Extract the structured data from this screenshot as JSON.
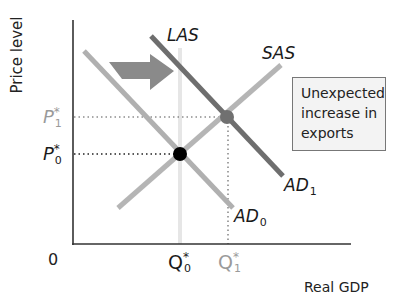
{
  "axes": {
    "y_label": "Price level",
    "x_label": "Real GDP",
    "origin_label": "0"
  },
  "price_levels": [
    {
      "symbol": "P",
      "star": "*",
      "subscript": "1",
      "color": "#9a9a9a"
    },
    {
      "symbol": "P",
      "star": "*",
      "subscript": "0",
      "color": "#1a1a1a"
    }
  ],
  "quantities": [
    {
      "symbol": "Q",
      "star": "*",
      "subscript": "0",
      "color": "#1a1a1a"
    },
    {
      "symbol": "Q",
      "star": "*",
      "subscript": "1",
      "color": "#9a9a9a"
    }
  ],
  "curves": {
    "las": {
      "name": "LAS",
      "color": "#e6e6e6"
    },
    "sas": {
      "name": "SAS",
      "color": "#b5b5b5"
    },
    "ad0": {
      "name": "AD",
      "subscript": "0",
      "color": "#b0b0b0"
    },
    "ad1": {
      "name": "AD",
      "subscript": "1",
      "color": "#6e6e6e"
    }
  },
  "equilibria": [
    {
      "name": "initial",
      "color": "#000000"
    },
    {
      "name": "new",
      "color": "#707070"
    }
  ],
  "shift_arrow": {
    "direction": "right",
    "color": "#8a8a8a"
  },
  "callout": {
    "lines": [
      "Unexpected",
      "increase in",
      "exports"
    ]
  },
  "colors": {
    "axis": "#333333",
    "guide_dots": "#555555",
    "callout_border": "#777777",
    "callout_bg": "#f3f3f3"
  }
}
